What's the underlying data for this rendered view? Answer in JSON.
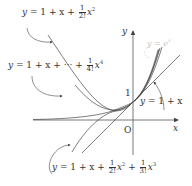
{
  "diagram": {
    "axes": {
      "x_label": "x",
      "y_label": "y",
      "origin_label": "O",
      "y_intercept_label": "1"
    },
    "curves": [
      {
        "id": "linear",
        "label": "y = 1 + x",
        "eq_parts": {
          "lhs": "y",
          "rhs": "1 + x"
        }
      },
      {
        "id": "quadratic",
        "label": "y = 1 + x + (1/2!) x^2",
        "eq_parts": {
          "lhs": "y",
          "pre": "1 + x +",
          "num": "1",
          "den": "2!",
          "var": "x",
          "exp": "2"
        }
      },
      {
        "id": "cubic",
        "label": "y = 1 + x + (1/2!) x^2 + (1/3!) x^3",
        "eq_parts": {
          "lhs": "y",
          "pre": "1 + x +",
          "num1": "1",
          "den1": "2!",
          "var1": "x",
          "exp1": "2",
          "mid": "+",
          "num2": "1",
          "den2": "3!",
          "var2": "x",
          "exp2": "3"
        }
      },
      {
        "id": "quartic",
        "label": "y = 1 + x + ··· + (1/4!) x^4",
        "eq_parts": {
          "lhs": "y",
          "pre": "1 + x + ··· +",
          "num": "1",
          "den": "4!",
          "var": "x",
          "exp": "4"
        }
      },
      {
        "id": "exponential",
        "label": "y = e^x",
        "eq_parts": {
          "lhs": "y",
          "base": "e",
          "exp": "x"
        }
      }
    ],
    "colors": {
      "axis": "#555555",
      "curve": "#444444",
      "text": "#333333",
      "faded_label": "#c4c4c4"
    }
  }
}
